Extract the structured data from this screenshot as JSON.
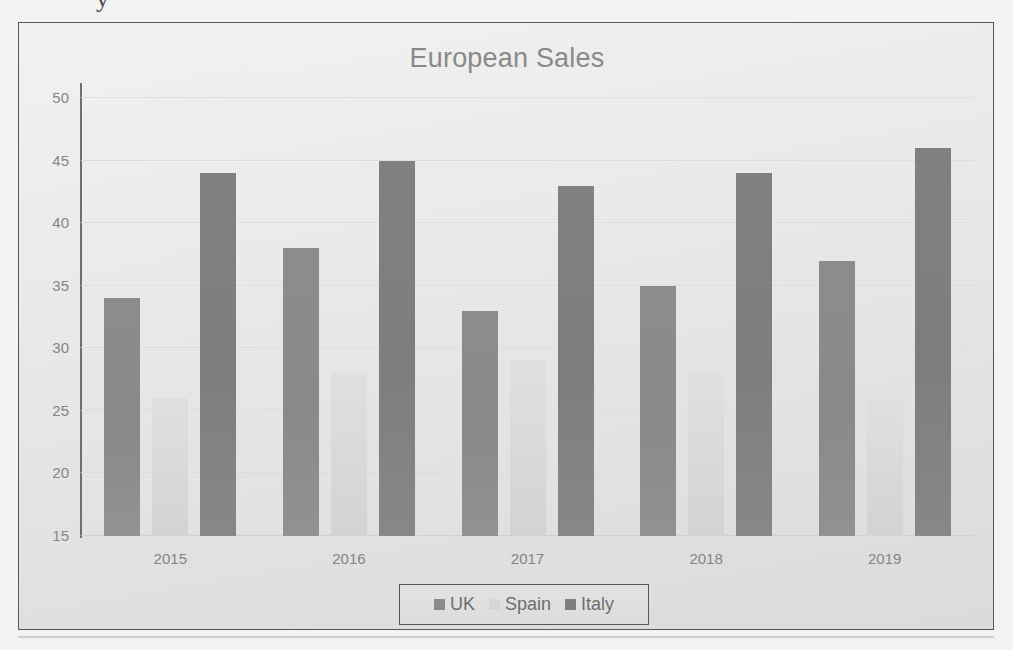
{
  "page": {
    "clipped_text_above_frame": "y",
    "border_color": "#575757"
  },
  "chart_data": {
    "type": "bar",
    "title": "European Sales",
    "subtitle": "",
    "xlabel": "",
    "ylabel": "",
    "categories": [
      "2015",
      "2016",
      "2017",
      "2018",
      "2019"
    ],
    "series": [
      {
        "name": "UK",
        "color": "#8b8b8b",
        "values": [
          34,
          38,
          33,
          35,
          37
        ]
      },
      {
        "name": "Spain",
        "color": "#dadad8",
        "values": [
          26,
          28,
          29,
          28,
          26
        ]
      },
      {
        "name": "Italy",
        "color": "#7f7f7f",
        "values": [
          44,
          45,
          43,
          44,
          46
        ]
      }
    ],
    "ylim": [
      15,
      50
    ],
    "yticks": [
      15,
      20,
      25,
      30,
      35,
      40,
      45,
      50
    ],
    "grid": true,
    "legend_position": "bottom",
    "legend_entries": [
      "UK",
      "Spain",
      "Italy"
    ]
  }
}
